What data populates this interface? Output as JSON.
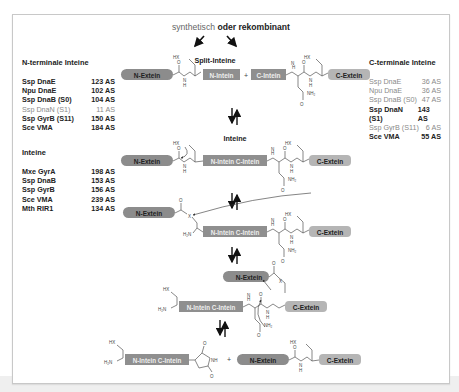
{
  "header": {
    "synthetic_label": "synthetisch",
    "or_recombinant": "oder rekombinant"
  },
  "stage_labels": {
    "split": "Split-Inteine",
    "intein": "Inteine"
  },
  "segments": {
    "n_extein": "N-Extein",
    "c_extein": "C-Extein",
    "n_intein": "N-Intein",
    "c_intein": "C-Intein",
    "n_c_intein": "N-Intein C-Intein",
    "plus": "+"
  },
  "chem": {
    "hx": "HX",
    "o": "O",
    "n": "N",
    "h": "H",
    "nh2": "NH₂",
    "h2n": "H₂N",
    "x": "X",
    "nh": "NH"
  },
  "tables": {
    "n_terminal": {
      "title": "N-terminale Inteine",
      "rows": [
        {
          "name": "Ssp DnaE",
          "size": "123 AS",
          "muted": false
        },
        {
          "name": "Npu DnaE",
          "size": "102 AS",
          "muted": false
        },
        {
          "name": "Ssp DnaB (S0)",
          "size": "104 AS",
          "muted": false
        },
        {
          "name": "Ssp DnaN (S1)",
          "size": "11 AS",
          "muted": true
        },
        {
          "name": "Ssp GyrB (S11)",
          "size": "150 AS",
          "muted": false
        },
        {
          "name": "Sce VMA",
          "size": "184 AS",
          "muted": false
        }
      ]
    },
    "inteine": {
      "title": "Inteine",
      "rows": [
        {
          "name": "Mxe GyrA",
          "size": "198 AS",
          "muted": false
        },
        {
          "name": "Ssp DnaB",
          "size": "153 AS",
          "muted": false
        },
        {
          "name": "Ssp GyrB",
          "size": "156 AS",
          "muted": false
        },
        {
          "name": "Sce VMA",
          "size": "239 AS",
          "muted": false
        },
        {
          "name": "Mth RIR1",
          "size": "134 AS",
          "muted": false
        }
      ]
    },
    "c_terminal": {
      "title": "C-terminale Inteine",
      "rows": [
        {
          "name": "Ssp DnaE",
          "size": "36 AS",
          "muted": true
        },
        {
          "name": "Npu DnaE",
          "size": "36 AS",
          "muted": true
        },
        {
          "name": "Ssp DnaB (S0)",
          "size": "47 AS",
          "muted": true
        },
        {
          "name": "Ssp DnaN (S1)",
          "size": "143 AS",
          "muted": false
        },
        {
          "name": "Ssp GyrB (S11)",
          "size": "6 AS",
          "muted": true
        },
        {
          "name": "Sce VMA",
          "size": "55 AS",
          "muted": false
        }
      ]
    }
  },
  "colors": {
    "n_extein_fill": "#8c8c8c",
    "c_extein_fill": "#b5b5b5",
    "intein_fill": "#8f8f8f",
    "frame_border": "#c8c8c8",
    "bond": "#555555"
  }
}
